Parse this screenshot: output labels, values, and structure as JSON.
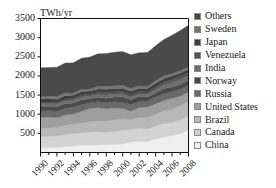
{
  "figure": {
    "background": "#ffffff",
    "axis_unit_label": "TWh/yr"
  },
  "chart_data": {
    "type": "area",
    "stacked": true,
    "title": "",
    "subtitle": "",
    "xlabel": "",
    "ylabel": "TWh/yr",
    "ylim": [
      0,
      3500
    ],
    "xlim": [
      1990,
      2008
    ],
    "grid": false,
    "legend_position": "right",
    "ytick_labels": [
      "3500",
      "3000",
      "2500",
      "2000",
      "1500",
      "1000",
      "500"
    ],
    "ytick_values": [
      3500,
      3000,
      2500,
      2000,
      1500,
      1000,
      500
    ],
    "xtick_labels": [
      "1990",
      "1992",
      "1994",
      "1996",
      "1998",
      "2000",
      "2002",
      "2004",
      "2006",
      "2008"
    ],
    "xtick_values": [
      1990,
      1992,
      1994,
      1996,
      1998,
      2000,
      2002,
      2004,
      2006,
      2008
    ],
    "x": [
      1990,
      1991,
      1992,
      1993,
      1994,
      1995,
      1996,
      1997,
      1998,
      1999,
      2000,
      2001,
      2002,
      2003,
      2004,
      2005,
      2006,
      2007,
      2008
    ],
    "stack_order_bottom_to_top": [
      "China",
      "Canada",
      "Brazil",
      "United States",
      "Russia",
      "Norway",
      "India",
      "Venezuela",
      "Japan",
      "Sweden",
      "Others"
    ],
    "series": [
      {
        "name": "Others",
        "color": "#4a4a4a",
        "values": [
          740,
          745,
          760,
          775,
          790,
          805,
          835,
          850,
          860,
          875,
          880,
          875,
          865,
          885,
          915,
          950,
          1000,
          1045,
          1085
        ]
      },
      {
        "name": "Sweden",
        "color": "#757575",
        "values": [
          72,
          63,
          75,
          74,
          58,
          67,
          51,
          68,
          74,
          71,
          78,
          79,
          66,
          53,
          60,
          72,
          61,
          66,
          69
        ]
      },
      {
        "name": "Japan",
        "color": "#3e3e3e",
        "values": [
          89,
          95,
          84,
          95,
          73,
          91,
          82,
          91,
          96,
          85,
          87,
          86,
          84,
          94,
          100,
          86,
          95,
          84,
          83
        ]
      },
      {
        "name": "Venezuela",
        "color": "#555555",
        "values": [
          36,
          38,
          41,
          44,
          47,
          49,
          50,
          53,
          57,
          60,
          61,
          62,
          60,
          59,
          70,
          74,
          81,
          82,
          86
        ]
      },
      {
        "name": "India",
        "color": "#6e6e6e",
        "values": [
          72,
          73,
          70,
          71,
          82,
          73,
          69,
          75,
          82,
          81,
          74,
          74,
          64,
          69,
          85,
          101,
          114,
          123,
          114
        ]
      },
      {
        "name": "Norway",
        "color": "#4a4a4a",
        "values": [
          121,
          110,
          117,
          120,
          113,
          123,
          104,
          111,
          117,
          122,
          143,
          122,
          130,
          107,
          110,
          137,
          121,
          135,
          140
        ]
      },
      {
        "name": "Russia",
        "color": "#6a6a6a",
        "values": [
          167,
          168,
          173,
          175,
          177,
          177,
          155,
          158,
          159,
          161,
          165,
          176,
          164,
          158,
          177,
          174,
          175,
          179,
          167
        ]
      },
      {
        "name": "United States",
        "color": "#9e9e9e",
        "values": [
          292,
          288,
          246,
          270,
          261,
          306,
          344,
          352,
          319,
          314,
          271,
          210,
          259,
          271,
          265,
          267,
          286,
          248,
          249
        ]
      },
      {
        "name": "Brazil",
        "color": "#b8b8b8",
        "values": [
          204,
          217,
          225,
          241,
          251,
          252,
          265,
          277,
          290,
          297,
          302,
          262,
          282,
          298,
          315,
          334,
          345,
          370,
          370
        ]
      },
      {
        "name": "Canada",
        "color": "#d3d3d3",
        "values": [
          294,
          300,
          303,
          318,
          325,
          330,
          350,
          348,
          330,
          341,
          355,
          330,
          344,
          334,
          337,
          360,
          351,
          368,
          377
        ]
      },
      {
        "name": "China",
        "color": "#efefef",
        "values": [
          127,
          125,
          131,
          152,
          167,
          191,
          188,
          196,
          204,
          212,
          222,
          277,
          288,
          283,
          353,
          397,
          435,
          485,
          585
        ]
      }
    ]
  },
  "legend": {
    "items": [
      {
        "label": "Others",
        "color": "#4a4a4a"
      },
      {
        "label": "Sweden",
        "color": "#757575"
      },
      {
        "label": "Japan",
        "color": "#3e3e3e"
      },
      {
        "label": "Venezuela",
        "color": "#555555"
      },
      {
        "label": "India",
        "color": "#6e6e6e"
      },
      {
        "label": "Norway",
        "color": "#4a4a4a"
      },
      {
        "label": "Russia",
        "color": "#6a6a6a"
      },
      {
        "label": "United States",
        "color": "#9e9e9e"
      },
      {
        "label": "Brazil",
        "color": "#b8b8b8"
      },
      {
        "label": "Canada",
        "color": "#d3d3d3"
      },
      {
        "label": "China",
        "color": "#efefef"
      }
    ]
  }
}
